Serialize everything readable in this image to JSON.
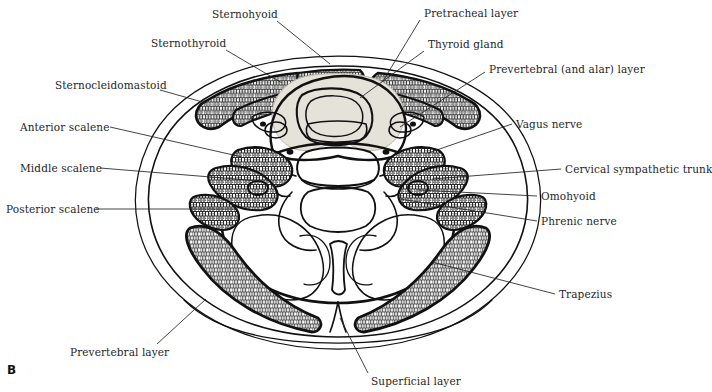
{
  "figure": {
    "letter": "B",
    "caption_absent": true,
    "background_color": "#ffffff",
    "ink_color": "#111111",
    "text_color": "#262626",
    "thyroid_fill": "#e3e0d8",
    "muscle_stipple_dark": "#4a4a4a",
    "muscle_stipple_light": "#9a9a9a"
  },
  "labels": [
    {
      "id": "sternohyoid",
      "text": "Sternohyoid",
      "x": 212,
      "y": 8,
      "align": "left"
    },
    {
      "id": "sternothyroid",
      "text": "Sternothyroid",
      "x": 151,
      "y": 37,
      "align": "left"
    },
    {
      "id": "sternocleidomastoid",
      "text": "Sternocleidomastoid",
      "x": 55,
      "y": 79,
      "align": "left"
    },
    {
      "id": "anterior-scalene",
      "text": "Anterior scalene",
      "x": 20,
      "y": 121,
      "align": "left"
    },
    {
      "id": "middle-scalene",
      "text": "Middle scalene",
      "x": 20,
      "y": 162,
      "align": "left"
    },
    {
      "id": "posterior-scalene",
      "text": "Posterior scalene",
      "x": 6,
      "y": 203,
      "align": "left"
    },
    {
      "id": "prevertebral-layer",
      "text": "Prevertebral layer",
      "x": 70,
      "y": 346,
      "align": "left"
    },
    {
      "id": "superficial-layer",
      "text": "Superficial layer",
      "x": 371,
      "y": 375,
      "align": "left"
    },
    {
      "id": "pretracheal-layer",
      "text": "Pretracheal layer",
      "x": 424,
      "y": 7,
      "align": "left"
    },
    {
      "id": "thyroid-gland",
      "text": "Thyroid gland",
      "x": 428,
      "y": 38,
      "align": "left"
    },
    {
      "id": "prevertebral-and-alar-layer",
      "text": "Prevertebral (and alar) layer",
      "x": 489,
      "y": 63,
      "align": "left"
    },
    {
      "id": "vagus-nerve",
      "text": "Vagus nerve",
      "x": 516,
      "y": 118,
      "align": "left"
    },
    {
      "id": "cervical-sympathetic-trunk",
      "text": "Cervical sympathetic trunk",
      "x": 565,
      "y": 163,
      "align": "left"
    },
    {
      "id": "omohyoid",
      "text": "Omohyoid",
      "x": 541,
      "y": 190,
      "align": "left"
    },
    {
      "id": "phrenic-nerve",
      "text": "Phrenic nerve",
      "x": 541,
      "y": 215,
      "align": "left"
    },
    {
      "id": "trapezius",
      "text": "Trapezius",
      "x": 559,
      "y": 288,
      "align": "left"
    }
  ],
  "leaders": [
    {
      "id": "leader-sternohyoid",
      "points": "277,21 330,64"
    },
    {
      "id": "leader-sternothyroid",
      "points": "226,50 282,83"
    },
    {
      "id": "leader-sternocleidomastoid",
      "points": "160,90 206,103"
    },
    {
      "id": "leader-anterior-scalene",
      "points": "110,127 242,157"
    },
    {
      "id": "leader-middle-scalene",
      "points": "100,168 260,181"
    },
    {
      "id": "leader-posterior-scalene",
      "points": "96,209 238,209"
    },
    {
      "id": "leader-prevertebral-layer",
      "points": "157,344 206,299"
    },
    {
      "id": "leader-superficial-layer",
      "points": "368,373 340,318"
    },
    {
      "id": "leader-pretracheal-layer",
      "points": "420,20 383,81"
    },
    {
      "id": "leader-thyroid-gland",
      "points": "424,51 360,98"
    },
    {
      "id": "leader-prevertebral-and-alar-layer",
      "points": "485,72 400,127"
    },
    {
      "id": "leader-vagus-nerve",
      "points": "512,124 428,153"
    },
    {
      "id": "leader-cervical-sympathetic-trunk",
      "points": "561,169 432,179"
    },
    {
      "id": "leader-omohyoid",
      "points": "537,196 418,190"
    },
    {
      "id": "leader-phrenic-nerve",
      "points": "537,221 400,199"
    },
    {
      "id": "leader-trapezius",
      "points": "555,294 432,262"
    }
  ]
}
